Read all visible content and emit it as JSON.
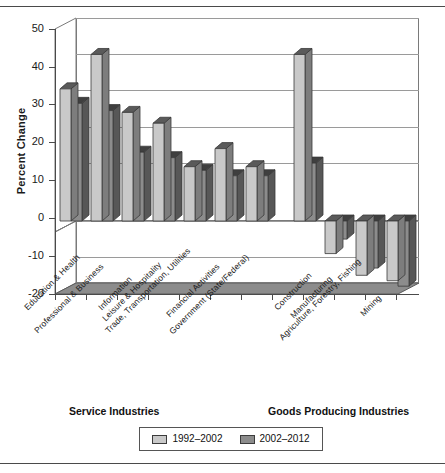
{
  "chart_data": {
    "type": "bar",
    "title": "",
    "xlabel": "",
    "ylabel": "Percent Change",
    "ylim": [
      -20,
      50
    ],
    "yticks": [
      50,
      40,
      30,
      20,
      10,
      0,
      -10,
      -20
    ],
    "ytick_labels": [
      "50",
      "40",
      "30",
      "20",
      "10",
      "0",
      "-10",
      "-20"
    ],
    "grid": true,
    "legend_position": "bottom",
    "three_d": true,
    "categories": [
      "Education & Health",
      "Professional & Business",
      "Information",
      "Leisure & Hospitality",
      "Trade, Transportation, Utilities",
      "Financial Activities",
      "Government (State/Federal)",
      "Construction",
      "Manufacturing",
      "Agriculture, Forestry, Fishing",
      "Mining"
    ],
    "series": [
      {
        "name": "1992–2002",
        "color": "#c9c9c9",
        "values": [
          36.5,
          46.0,
          30.0,
          27.0,
          15.0,
          20.0,
          15.0,
          46.0,
          -9.0,
          -15.0,
          -16.5
        ]
      },
      {
        "name": "2002–2012",
        "color": "#8c8c8c",
        "values": [
          32.5,
          30.5,
          19.0,
          17.5,
          14.0,
          12.5,
          12.5,
          16.0,
          -5.0,
          -13.0,
          -18.0
        ]
      }
    ],
    "groups": [
      {
        "label": "Service Industries",
        "from": 0,
        "to": 6
      },
      {
        "label": "Goods Producing Industries",
        "from": 7,
        "to": 10
      }
    ]
  },
  "legend": {
    "items": [
      {
        "label": "1992–2002",
        "color": "#c9c9c9"
      },
      {
        "label": "2002–2012",
        "color": "#8c8c8c"
      }
    ]
  },
  "axis": {
    "y_title": "Percent Change"
  }
}
